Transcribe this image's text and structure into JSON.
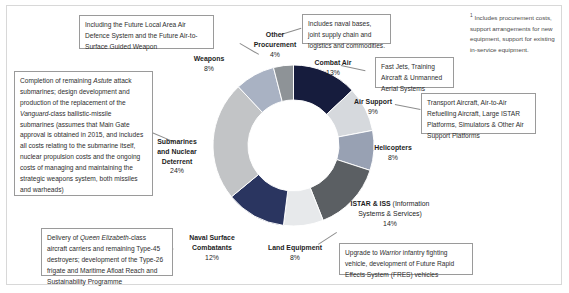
{
  "footnote": {
    "marker": "1",
    "text": "Includes procurement costs, support arrangements for new equipment, support for existing in-service equipment."
  },
  "callouts": {
    "weapons": "Including the Future Local Area Air Defence System and the Future Air-to-Surface Guided Weapon",
    "submarines": "Completion of remaining Astute attack submarines; design development and production of the replacement of the Vanguard-class ballistic-missile submarines (assumes that Main Gate approval is obtained in 2015, and includes all costs relating to the submarine itself, nuclear propulsion costs and the ongoing costs of managing and maintaining the strategic weapons system, both missiles and warheads)",
    "naval": "Delivery of Queen Elizabeth-class aircraft carriers and remaining Type-45 destroyers; development of the Type-26 frigate and Maritime Afloat Reach and Sustainability Programme",
    "other_procurement": "Includes naval bases, joint supply chain and logistics and commodities.",
    "combat_air": "Fast Jets, Training Aircraft & Unmanned Aerial Systems",
    "air_support": "Transport Aircraft, Air-to-Air Refuelling Aircraft, Large ISTAR Platforms, Simulators & Other Air Support Platforms",
    "land_equipment": "Upgrade to Warrior infantry fighting vehicle, development of Future Rapid Effects System (FRES) vehicles"
  },
  "chart_data": {
    "type": "pie",
    "title": "",
    "variant": "donut",
    "legend_position": "around-slices",
    "units": "percent",
    "total": 100,
    "categories": [
      "Combat Air",
      "Air Support",
      "Helicopters",
      "ISTAR & ISS (Information Systems & Services)",
      "Land Equipment",
      "Naval Surface Combatants",
      "Submarines and Nuclear Deterrent",
      "Weapons",
      "Other Procurement"
    ],
    "values": [
      13,
      9,
      8,
      14,
      8,
      12,
      24,
      8,
      4
    ],
    "colors": [
      "#161c3d",
      "#d6d9dd",
      "#98a1b3",
      "#5b5f63",
      "#e7e9eb",
      "#2a3560",
      "#c2c4c6",
      "#a9b2c3",
      "#8e9397"
    ],
    "slices": [
      {
        "name": "Combat Air",
        "name_sub": "",
        "value": 13,
        "label": "13%",
        "color": "#161c3d"
      },
      {
        "name": "Air Support",
        "name_sub": "",
        "value": 9,
        "label": "9%",
        "color": "#d6d9dd"
      },
      {
        "name": "Helicopters",
        "name_sub": "",
        "value": 8,
        "label": "8%",
        "color": "#98a1b3"
      },
      {
        "name": "ISTAR & ISS",
        "name_sub": "(Information Systems & Services)",
        "value": 14,
        "label": "14%",
        "color": "#5b5f63"
      },
      {
        "name": "Land Equipment",
        "name_sub": "",
        "value": 8,
        "label": "8%",
        "color": "#e7e9eb"
      },
      {
        "name": "Naval Surface Combatants",
        "name_sub": "",
        "value": 12,
        "label": "12%",
        "color": "#2a3560"
      },
      {
        "name": "Submarines and Nuclear Deterrent",
        "name_sub": "",
        "value": 24,
        "label": "24%",
        "color": "#c2c4c6"
      },
      {
        "name": "Weapons",
        "name_sub": "",
        "value": 8,
        "label": "8%",
        "color": "#a9b2c3"
      },
      {
        "name": "Other Procurement",
        "name_sub": "",
        "value": 4,
        "label": "4%",
        "color": "#8e9397"
      }
    ]
  },
  "labels": {
    "other_procurement_l1": "Other",
    "other_procurement_l2": "Procurement",
    "other_procurement_pc": "4%",
    "weapons_nm": "Weapons",
    "weapons_pc": "8%",
    "combat_air_nm": "Combat Air",
    "combat_air_pc": "13%",
    "air_support_nm": "Air Support",
    "air_support_pc": "9%",
    "helicopters_nm": "Helicopters",
    "helicopters_pc": "8%",
    "istar_nm": "ISTAR & ISS",
    "istar_sub1": " (Information",
    "istar_sub2": "Systems & Services)",
    "istar_pc": "14%",
    "land_nm": "Land Equipment",
    "land_pc": "8%",
    "naval_l1": "Naval Surface",
    "naval_l2": "Combatants",
    "naval_pc": "12%",
    "subs_l1": "Submarines",
    "subs_l2": "and Nuclear",
    "subs_l3": "Deterrent",
    "subs_pc": "24%"
  }
}
